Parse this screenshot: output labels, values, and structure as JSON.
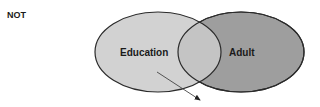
{
  "operator": "NOT",
  "sets": [
    {
      "name": "Education",
      "fill": "#d2d2d2"
    },
    {
      "name": "Adult",
      "fill": "#9e9e9e"
    }
  ],
  "intersection_fill": "#c4c4c4",
  "stroke": "#2b2b2b",
  "arrow": {
    "from": "Education",
    "direction": "down-right",
    "color": "#444444"
  }
}
